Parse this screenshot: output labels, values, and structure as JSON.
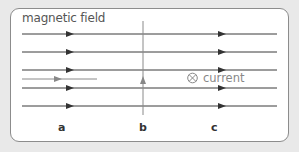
{
  "diagram": {
    "title": "magnetic field",
    "current_label": "current",
    "current_symbol": "into-page-circle-x-icon",
    "field_lines": [
      {
        "y": 34,
        "x1": 22,
        "x2": 277,
        "arrows": [
          70,
          222
        ],
        "color": "#3a3a3a"
      },
      {
        "y": 52,
        "x1": 22,
        "x2": 277,
        "arrows": [
          70,
          222
        ],
        "color": "#3a3a3a"
      },
      {
        "y": 70,
        "x1": 22,
        "x2": 277,
        "arrows": [
          70,
          222
        ],
        "color": "#3a3a3a"
      },
      {
        "y": 88,
        "x1": 22,
        "x2": 277,
        "arrows": [
          70,
          222
        ],
        "color": "#3a3a3a"
      },
      {
        "y": 106,
        "x1": 22,
        "x2": 277,
        "arrows": [
          70,
          222
        ],
        "color": "#3a3a3a"
      }
    ],
    "conductor_a": {
      "direction": "right",
      "color": "#888888"
    },
    "conductor_b": {
      "direction": "up",
      "color": "#888888"
    },
    "conductor_c": {
      "direction": "into-page",
      "color": "#888888"
    },
    "labels": {
      "a": "a",
      "b": "b",
      "c": "c"
    }
  }
}
